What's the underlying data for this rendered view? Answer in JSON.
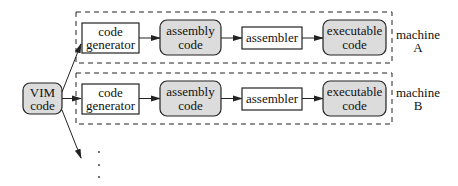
{
  "diagram": {
    "source": {
      "line1": "VIM",
      "line2": "code"
    },
    "pipelines": [
      {
        "code_generator": {
          "line1": "code",
          "line2": "generator"
        },
        "assembly": {
          "line1": "assembly",
          "line2": "code"
        },
        "assembler": {
          "label": "assembler"
        },
        "executable": {
          "line1": "executable",
          "line2": "code"
        },
        "machine": {
          "line1": "machine",
          "line2": "A"
        }
      },
      {
        "code_generator": {
          "line1": "code",
          "line2": "generator"
        },
        "assembly": {
          "line1": "assembly",
          "line2": "code"
        },
        "assembler": {
          "label": "assembler"
        },
        "executable": {
          "line1": "executable",
          "line2": "code"
        },
        "machine": {
          "line1": "machine",
          "line2": "B"
        }
      }
    ],
    "continuation": "⋮",
    "colors": {
      "shaded_fill": "#dcdcdc",
      "stroke": "#222222"
    }
  }
}
